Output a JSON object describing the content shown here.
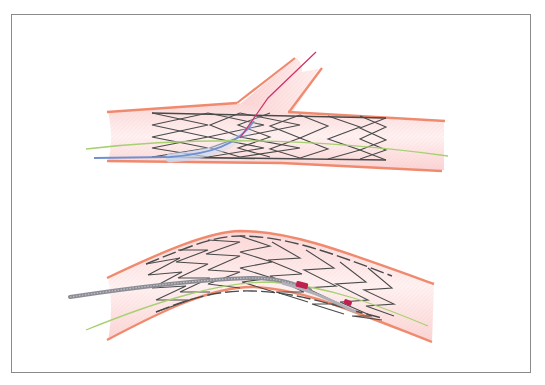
{
  "figure": {
    "description": "Illustration of coronary stenting: top panel shows a stent in a main vessel at a bifurcation with a guidewire passed into the side branch; bottom panel shows a stent in a curved vessel with a delivery catheter and balloon markers",
    "panels": [
      {
        "id": "top",
        "label": "Bifurcation stent with side-branch guidewire",
        "elements": [
          "vessel-wall",
          "side-branch",
          "stent-struts",
          "main-guidewire",
          "side-branch-guidewire",
          "balloon-catheter"
        ]
      },
      {
        "id": "bottom",
        "label": "Curved vessel stent with delivery catheter",
        "elements": [
          "vessel-wall",
          "stent-struts",
          "guidewire",
          "delivery-catheter",
          "radiopaque-markers"
        ]
      }
    ],
    "colors": {
      "vessel_wall": "#f08a6e",
      "vessel_fill": "#fbe0e0",
      "stent": "#4a4a4a",
      "guidewire_green": "#a8d070",
      "guidewire_red": "#d0306a",
      "catheter_blue": "#7090d0",
      "catheter_gray": "#8c8c94",
      "marker_magenta": "#c02050",
      "frame_border": "#8a8a8a"
    }
  }
}
